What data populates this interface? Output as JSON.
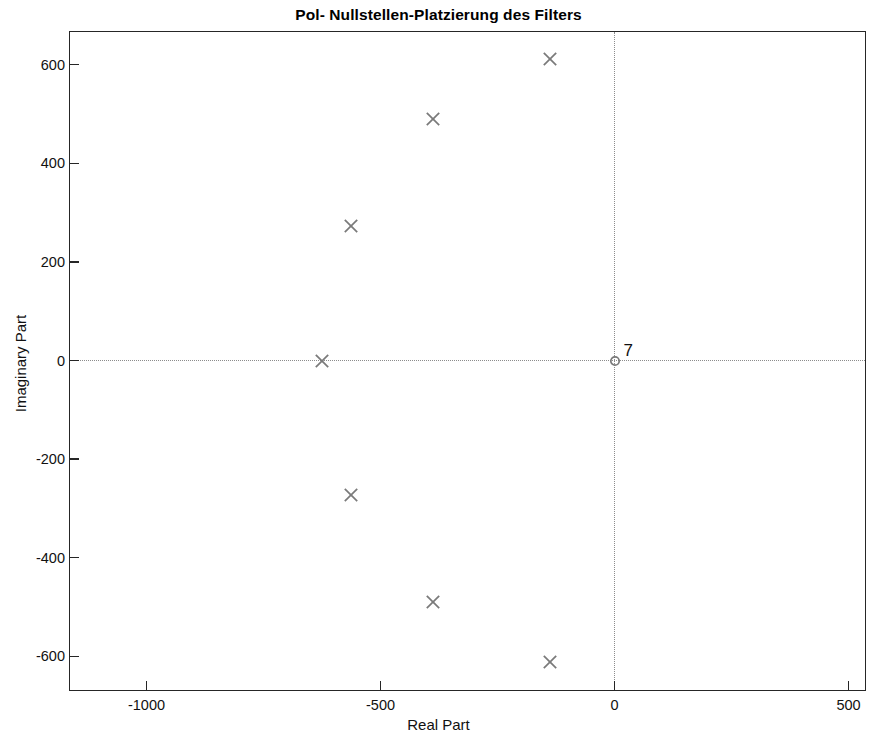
{
  "chart_data": {
    "type": "scatter",
    "title": "Pol- Nullstellen-Platzierung des Filters",
    "xlabel": "Real Part",
    "ylabel": "Imaginary Part",
    "xlim": [
      -1150,
      500
    ],
    "ylim": [
      -668,
      668
    ],
    "xticks": [
      -1000,
      -500,
      0,
      500
    ],
    "xticklabels": [
      "-1000",
      "-500",
      "0",
      "500"
    ],
    "yticks": [
      600,
      400,
      200,
      0,
      -200,
      -400,
      -600
    ],
    "yticklabels": [
      "600",
      "400",
      "200",
      "0",
      "-200",
      "-400",
      "-600"
    ],
    "grid": false,
    "zero_axis_lines": true,
    "legend": null,
    "marker_color": "#7a7a7a",
    "series": [
      {
        "name": "poles",
        "marker": "x",
        "points": [
          {
            "re": -626,
            "im": 0
          },
          {
            "re": -564,
            "im": 272
          },
          {
            "re": -564,
            "im": -272
          },
          {
            "re": -387,
            "im": 490
          },
          {
            "re": -387,
            "im": -490
          },
          {
            "re": -137,
            "im": 611
          },
          {
            "re": -137,
            "im": -611
          }
        ]
      },
      {
        "name": "zeros",
        "marker": "o",
        "points": [
          {
            "re": 0,
            "im": 0,
            "label": "7"
          }
        ]
      }
    ],
    "annotations": [
      {
        "text": "7",
        "re": 0,
        "im": 0,
        "note": "multiplicity label next to zero at origin"
      }
    ]
  }
}
